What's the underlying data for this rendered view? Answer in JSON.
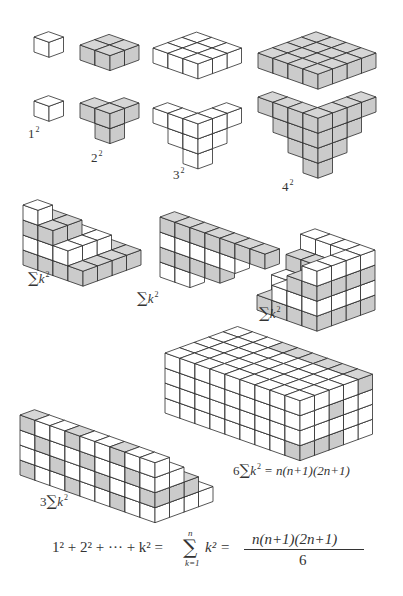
{
  "figure": {
    "projection": {
      "ax": [
        15,
        5.3
      ],
      "ay": [
        14.5,
        -5.3
      ],
      "az": [
        0,
        -15
      ]
    },
    "colors": {
      "stroke": "#2b2b2b",
      "white_top": "#ffffff",
      "white_side": "#ffffff",
      "gray_top": "#d6d6d6",
      "gray_side": "#cbcbcb"
    },
    "labels": {
      "one_sq": {
        "base": "1",
        "exp": "2"
      },
      "two_sq": {
        "base": "2",
        "exp": "2"
      },
      "three_sq": {
        "base": "3",
        "exp": "2"
      },
      "four_sq": {
        "base": "4",
        "exp": "2"
      },
      "sum_pyramid": {
        "sigma": "∑",
        "var": "k",
        "exp": "2"
      },
      "sum_slanted": {
        "sigma": "∑",
        "var": "k",
        "exp": "2"
      },
      "sum_stair": {
        "sigma": "∑",
        "var": "k",
        "exp": "2"
      },
      "three_sum": {
        "coef": "3",
        "sigma": "∑",
        "var": "k",
        "exp": "2"
      },
      "six_sum": {
        "coef": "6",
        "sigma": "∑",
        "var": "k",
        "exp": "2",
        "rhs": "= n(n+1)(2n+1)"
      }
    },
    "formula": {
      "lhs": "1² + 2² + ··· + k² =",
      "sum_top": "n",
      "sum_symbol": "∑",
      "sum_bottom": "k=1",
      "sum_term": "k² =",
      "numerator": "n(n+1)(2n+1)",
      "denominator": "6"
    }
  }
}
